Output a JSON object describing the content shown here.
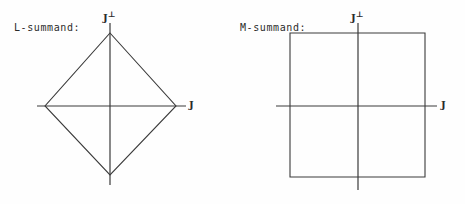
{
  "figure": {
    "width": 465,
    "height": 204,
    "background_color": "#fefefe",
    "line_color": "#3a3a3a",
    "text_color": "#2b2b2b"
  },
  "panels": [
    {
      "id": "l-summand",
      "caption": "L-summand:",
      "shape": "diamond",
      "axis_labels": {
        "vertical": "J",
        "vertical_superscript": "⊥",
        "horizontal": "J"
      },
      "axes": {
        "origin_x": 110,
        "origin_y": 106,
        "horizontal_x1": 37,
        "horizontal_x2": 186,
        "vertical_y1": 23,
        "vertical_y2": 185
      },
      "vertices": [
        {
          "x": 110,
          "y": 33
        },
        {
          "x": 176,
          "y": 106
        },
        {
          "x": 110,
          "y": 175
        },
        {
          "x": 45,
          "y": 106
        }
      ]
    },
    {
      "id": "m-summand",
      "caption": "M-summand:",
      "shape": "square",
      "axis_labels": {
        "vertical": "J",
        "vertical_superscript": "⊥",
        "horizontal": "J"
      },
      "axes": {
        "origin_x": 358,
        "origin_y": 106,
        "horizontal_x1": 276,
        "horizontal_x2": 437,
        "vertical_y1": 23,
        "vertical_y2": 190
      },
      "vertices": [
        {
          "x": 290,
          "y": 33
        },
        {
          "x": 425,
          "y": 33
        },
        {
          "x": 425,
          "y": 177
        },
        {
          "x": 290,
          "y": 177
        }
      ]
    }
  ]
}
